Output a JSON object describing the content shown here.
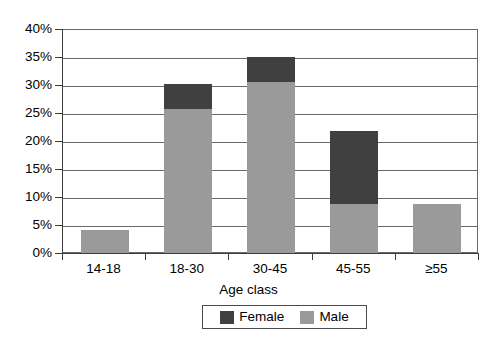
{
  "chart_data": {
    "type": "bar",
    "subtype": "stacked",
    "title": "",
    "xlabel": "Age class",
    "ylabel": "",
    "categories": [
      "14-18",
      "18-30",
      "30-45",
      "45-55",
      "≥55"
    ],
    "series": [
      {
        "name": "Female",
        "color": "#404040",
        "values": [
          0.0,
          4.5,
          4.5,
          13.1,
          0.0
        ]
      },
      {
        "name": "Male",
        "color": "#9a9a9a",
        "values": [
          4.3,
          25.9,
          30.7,
          8.9,
          8.9
        ]
      }
    ],
    "totals": [
      4.3,
      30.4,
      35.2,
      22.0,
      8.9
    ],
    "ylim": [
      0,
      40
    ],
    "ytick_values": [
      0,
      5,
      10,
      15,
      20,
      25,
      30,
      35,
      40
    ],
    "ytick_labels": [
      "0%",
      "5%",
      "10%",
      "15%",
      "20%",
      "25%",
      "30%",
      "35%",
      "40%"
    ],
    "grid": true,
    "grid_axis": "y",
    "legend_position": "bottom",
    "value_format": "percent"
  },
  "axes": {
    "x_title": "Age class",
    "y_ticks": [
      "0%",
      "5%",
      "10%",
      "15%",
      "20%",
      "25%",
      "30%",
      "35%",
      "40%"
    ],
    "x_ticks": [
      "14-18",
      "18-30",
      "30-45",
      "45-55",
      "≥55"
    ]
  },
  "legend": {
    "entries": [
      {
        "label": "Female",
        "color": "#404040"
      },
      {
        "label": "Male",
        "color": "#9a9a9a"
      }
    ]
  },
  "colors": {
    "female": "#404040",
    "male": "#9a9a9a",
    "grid": "#6a6a6a",
    "axis": "#3c3c3c",
    "background": "#ffffff"
  }
}
